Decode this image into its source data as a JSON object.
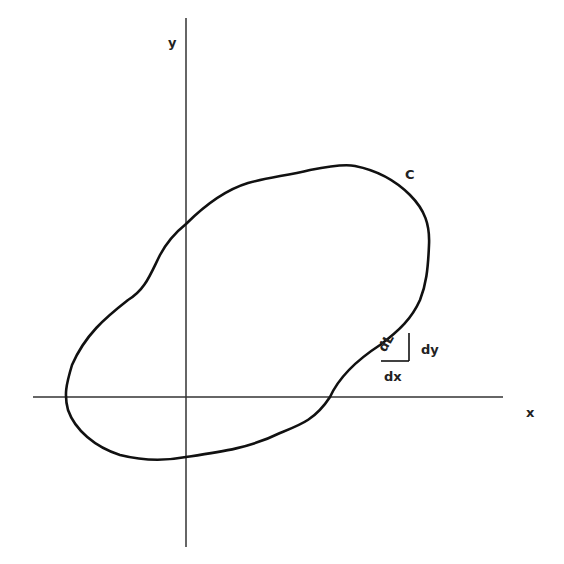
{
  "figure": {
    "axes": {
      "x_label": "x",
      "y_label": "y"
    },
    "curve_label": "C",
    "element": {
      "arc_label": "dL",
      "horizontal_label": "dx",
      "vertical_label": "dy"
    },
    "colors": {
      "stroke": "#111111",
      "axis": "#333333",
      "background": "#ffffff"
    }
  }
}
